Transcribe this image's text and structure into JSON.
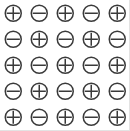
{
  "canvas": {
    "background": "#ffffff",
    "edge_color": "#e3e3e3",
    "width": 130,
    "height": 131
  },
  "symbols": {
    "stroke_color": "#3a3a3a",
    "stroke_width": 1.5,
    "circle_diameter": 16,
    "plus_name": "circled-plus",
    "minus_name": "circled-minus"
  },
  "grid": {
    "rows": 5,
    "cols": 5,
    "cell_size": 26,
    "cells": [
      [
        "plus",
        "minus",
        "plus",
        "minus",
        "plus"
      ],
      [
        "minus",
        "plus",
        "minus",
        "plus",
        "minus"
      ],
      [
        "plus",
        "minus",
        "plus",
        "minus",
        "plus"
      ],
      [
        "minus",
        "plus",
        "minus",
        "plus",
        "minus"
      ],
      [
        "plus",
        "minus",
        "plus",
        "minus",
        "plus"
      ]
    ]
  }
}
